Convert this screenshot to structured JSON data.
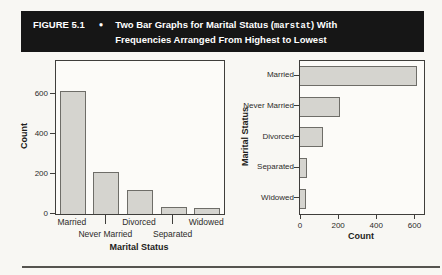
{
  "header": {
    "figure_label": "FIGURE 5.1",
    "bullet": "●",
    "title_line1_prefix": "Two Bar Graphs for Marital Status (",
    "title_mono": "marstat",
    "title_line1_suffix": ") With",
    "title_line2": "Frequencies Arranged From Highest to Lowest"
  },
  "colors": {
    "header_bg": "#161616",
    "bar_fill": "#d5d4cf",
    "bar_border": "#6e6d68"
  },
  "chart_data": [
    {
      "type": "bar",
      "orientation": "vertical",
      "title": "",
      "categories": [
        "Married",
        "Never Married",
        "Divorced",
        "Separated",
        "Widowed"
      ],
      "values": [
        615,
        210,
        120,
        35,
        30
      ],
      "xlabel": "Marital Status",
      "ylabel": "Count",
      "yticks": [
        0,
        200,
        400,
        600
      ],
      "ylim": [
        0,
        765
      ],
      "grid": false,
      "legend": false,
      "bar_fill": "#d5d4cf",
      "bar_border": "#6e6d68"
    },
    {
      "type": "bar",
      "orientation": "horizontal",
      "title": "",
      "categories": [
        "Married",
        "Never Married",
        "Divorced",
        "Separated",
        "Widowed"
      ],
      "values": [
        615,
        210,
        120,
        35,
        30
      ],
      "xlabel": "Count",
      "ylabel": "Marital Status",
      "xticks": [
        0,
        200,
        400,
        600
      ],
      "xlim": [
        0,
        650
      ],
      "grid": false,
      "legend": false,
      "bar_fill": "#d5d4cf",
      "bar_border": "#6e6d68"
    }
  ]
}
